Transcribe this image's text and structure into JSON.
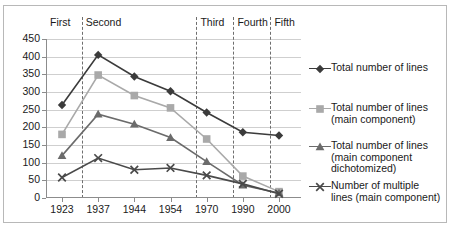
{
  "chart_data": {
    "type": "line",
    "title": "",
    "xlabel": "",
    "ylabel": "",
    "x": [
      "1923",
      "1937",
      "1944",
      "1954",
      "1970",
      "1990",
      "2000"
    ],
    "categories": [
      "1923",
      "1937",
      "1944",
      "1954",
      "1970",
      "1990",
      "2000"
    ],
    "ylim": [
      0,
      450
    ],
    "yticks": [
      0,
      50,
      100,
      150,
      200,
      250,
      300,
      350,
      400,
      450
    ],
    "ytick_labels": [
      "0",
      "50",
      "100",
      "150",
      "200",
      "250",
      "300",
      "350",
      "400",
      "450"
    ],
    "grid": true,
    "legend_position": "right",
    "series": [
      {
        "name": "Total number of lines",
        "marker": "diamond",
        "color": "#3b3b3b",
        "values": [
          263,
          405,
          344,
          302,
          242,
          186,
          177
        ]
      },
      {
        "name": "Total number of lines (main component)",
        "marker": "square",
        "color": "#a9a9a9",
        "values": [
          180,
          348,
          290,
          255,
          167,
          62,
          18
        ]
      },
      {
        "name": "Total number of lines (main component dichotomized)",
        "marker": "triangle",
        "color": "#6b6b6b",
        "values": [
          120,
          237,
          209,
          171,
          103,
          36,
          14
        ]
      },
      {
        "name": "Number of multiple lines (main component)",
        "marker": "cross",
        "color": "#4a4a4a",
        "values": [
          58,
          113,
          80,
          85,
          64,
          40,
          12
        ]
      }
    ],
    "period_bands": [
      {
        "label": "First",
        "left_pct": 0.0,
        "right_pct": 14.0
      },
      {
        "label": "Second",
        "left_pct": 14.0,
        "right_pct": 59.0
      },
      {
        "label": "Third",
        "left_pct": 59.0,
        "right_pct": 73.5
      },
      {
        "label": "Fourth",
        "left_pct": 73.5,
        "right_pct": 88.0
      },
      {
        "label": "Fifth",
        "left_pct": 88.0,
        "right_pct": 100.0
      }
    ],
    "dividers_pct": [
      14.0,
      59.0,
      73.5,
      88.0
    ],
    "annotations": []
  },
  "legend": {
    "entries": [
      {
        "label": "Total number of lines"
      },
      {
        "label": "Total number of lines\n(main component)"
      },
      {
        "label": "Total number of lines\n(main component\ndichotomized)"
      },
      {
        "label": "Number of multiple\nlines (main component)"
      }
    ]
  }
}
